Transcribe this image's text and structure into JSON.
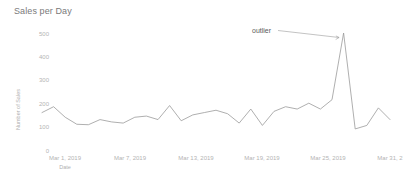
{
  "chart_data": {
    "type": "line",
    "title": "Sales per Day",
    "xlabel": "Date",
    "ylabel": "Number of Sales",
    "ylim": [
      0,
      520
    ],
    "yticks": [
      0,
      100,
      200,
      300,
      400,
      500
    ],
    "ytick_labels": [
      "0",
      "100",
      "200",
      "300",
      "400",
      "500"
    ],
    "xtick_labels": [
      "Mar 1, 2019",
      "Mar 7, 2019",
      "Mar 13, 2019",
      "Mar 19, 2019",
      "Mar 25, 2019",
      "Mar 31, 2"
    ],
    "grid": false,
    "legend": "none",
    "line_color": "#9a9a9a",
    "x": [
      "Mar 1, 2019",
      "Mar 2, 2019",
      "Mar 3, 2019",
      "Mar 4, 2019",
      "Mar 5, 2019",
      "Mar 6, 2019",
      "Mar 7, 2019",
      "Mar 8, 2019",
      "Mar 9, 2019",
      "Mar 10, 2019",
      "Mar 11, 2019",
      "Mar 12, 2019",
      "Mar 13, 2019",
      "Mar 14, 2019",
      "Mar 15, 2019",
      "Mar 16, 2019",
      "Mar 17, 2019",
      "Mar 18, 2019",
      "Mar 19, 2019",
      "Mar 20, 2019",
      "Mar 21, 2019",
      "Mar 22, 2019",
      "Mar 23, 2019",
      "Mar 24, 2019",
      "Mar 25, 2019",
      "Mar 26, 2019",
      "Mar 27, 2019",
      "Mar 28, 2019",
      "Mar 29, 2019",
      "Mar 30, 2019",
      "Mar 31, 2019"
    ],
    "values": [
      160,
      185,
      140,
      110,
      108,
      130,
      120,
      115,
      140,
      145,
      130,
      190,
      125,
      150,
      160,
      170,
      155,
      115,
      175,
      105,
      165,
      185,
      175,
      200,
      175,
      215,
      500,
      90,
      105,
      180,
      130
    ],
    "annotations": [
      {
        "label": "outlier",
        "points_to_index": 26,
        "points_to_value": 500
      }
    ]
  },
  "axis": {
    "ytick_0": "0",
    "ytick_100": "100",
    "ytick_200": "200",
    "ytick_300": "300",
    "ytick_400": "400",
    "ytick_500": "500",
    "xtick_1": "Mar 1, 2019",
    "xtick_2": "Mar 7, 2019",
    "xtick_3": "Mar 13, 2019",
    "xtick_4": "Mar 19, 2019",
    "xtick_5": "Mar 25, 2019",
    "xtick_6": "Mar 31, 2"
  }
}
